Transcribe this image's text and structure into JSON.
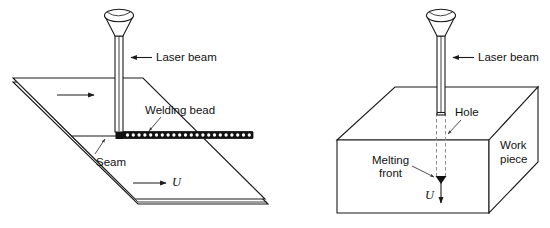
{
  "figure": {
    "background_color": "#ffffff",
    "line_color": "#1a1a1a",
    "dashed_color": "#8c8c8c",
    "panels": [
      {
        "id": "left-panel",
        "name": "seam-welding-of-plate",
        "labels": {
          "laser_beam": "Laser beam",
          "welding_bead": "Welding bead",
          "seam": "Seam",
          "velocity": "U"
        },
        "icons": {
          "laser_head": "laser-head-icon",
          "feed_arrow": "feed-direction-arrow-icon",
          "velocity_arrow": "velocity-arrow-icon",
          "bead_strip": "welding-bead-strip-icon"
        }
      },
      {
        "id": "right-panel",
        "name": "keyhole-welding-of-block",
        "labels": {
          "laser_beam": "Laser beam",
          "hole": "Hole",
          "melting_front_line1": "Melting",
          "melting_front_line2": "front",
          "work_piece_line1": "Work",
          "work_piece_line2": "piece",
          "velocity": "U"
        },
        "icons": {
          "laser_head": "laser-head-icon",
          "keyhole": "keyhole-dashed-icon",
          "velocity_arrow": "velocity-down-arrow-icon",
          "melting_front_marker": "melting-front-marker-icon"
        }
      }
    ]
  }
}
